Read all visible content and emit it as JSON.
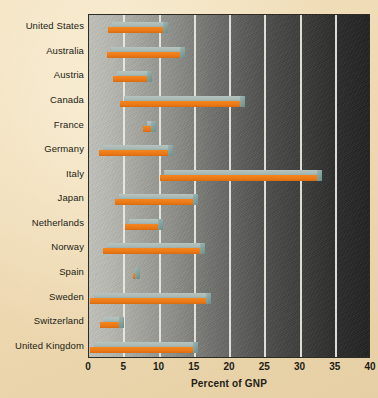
{
  "chart_data": {
    "type": "bar",
    "orientation": "horizontal",
    "subtype": "floating-range-bar-3d",
    "title": "",
    "xlabel": "Percent of GNP",
    "ylabel": "",
    "xlim": [
      0,
      40
    ],
    "xticks": [
      0,
      5,
      10,
      15,
      20,
      25,
      30,
      35,
      40
    ],
    "xtick_labels": [
      "0",
      "5",
      "10",
      "15",
      "20",
      "25",
      "30",
      "35",
      "40"
    ],
    "grid": "vertical-only",
    "legend": "none",
    "categories": [
      "United States",
      "Australia",
      "Austria",
      "Canada",
      "France",
      "Germany",
      "Italy",
      "Japan",
      "Netherlands",
      "Norway",
      "Spain",
      "Sweden",
      "Switzerland",
      "United Kingdom"
    ],
    "bars": [
      {
        "category": "United States",
        "start": 2.7,
        "end": 10.6,
        "span": 7.9
      },
      {
        "category": "Australia",
        "start": 2.6,
        "end": 13.0,
        "span": 10.4
      },
      {
        "category": "Austria",
        "start": 3.4,
        "end": 8.4,
        "span": 5.0
      },
      {
        "category": "Canada",
        "start": 4.4,
        "end": 21.6,
        "span": 17.2
      },
      {
        "category": "France",
        "start": 7.7,
        "end": 9.0,
        "span": 1.3
      },
      {
        "category": "Germany",
        "start": 1.4,
        "end": 11.4,
        "span": 10.0
      },
      {
        "category": "Italy",
        "start": 10.0,
        "end": 32.5,
        "span": 22.5
      },
      {
        "category": "Japan",
        "start": 3.7,
        "end": 14.9,
        "span": 11.2
      },
      {
        "category": "Netherlands",
        "start": 5.1,
        "end": 9.9,
        "span": 4.8
      },
      {
        "category": "Norway",
        "start": 2.0,
        "end": 15.9,
        "span": 13.9
      },
      {
        "category": "Spain",
        "start": 6.2,
        "end": 6.5,
        "span": 0.3
      },
      {
        "category": "Sweden",
        "start": 0.2,
        "end": 16.7,
        "span": 16.5
      },
      {
        "category": "Switzerland",
        "start": 1.6,
        "end": 4.4,
        "span": 2.8
      },
      {
        "category": "United Kingdom",
        "start": 0.2,
        "end": 14.9,
        "span": 14.7
      }
    ],
    "colors": {
      "bar_front": "#ec7a17",
      "bar_top": "#a8b8b3",
      "bar_cap": "#7fa09c",
      "gridline": "#eceae2",
      "page_background": "#eed9b2",
      "plot_gradient_start": "#c3c3bd",
      "plot_gradient_end": "#222222",
      "text": "#221c14"
    }
  }
}
